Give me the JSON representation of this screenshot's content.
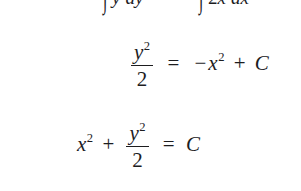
{
  "document": {
    "type": "math-worksheet-fragment",
    "background_color": "#ffffff",
    "text_color": "#1d1d1f"
  },
  "lines": {
    "integrals": {
      "id": "line-integrals",
      "clipped": "top",
      "left_integral": {
        "symbol": "∫",
        "integrand_var": "y",
        "differential": "dy"
      },
      "right_integral": {
        "symbol": "∫",
        "coefficient": "2",
        "integrand_var": "x",
        "differential": "dx"
      },
      "plain_text": "∫ y dy        ∫ 2x dx"
    },
    "antiderivative": {
      "id": "line-antideriv",
      "clipped": "right",
      "lhs": {
        "fraction_numerator_var": "y",
        "fraction_numerator_exponent": "2",
        "fraction_denominator": "2"
      },
      "relation": "=",
      "rhs": {
        "sign": "−",
        "term_var": "x",
        "term_exponent": "2",
        "plus": "+",
        "constant": "C"
      },
      "plain_text": "y²/2 = −x² + C"
    },
    "solution": {
      "id": "line-solution",
      "clipped": "none",
      "first_term_var": "x",
      "first_term_exponent": "2",
      "plus": "+",
      "fraction_numerator_var": "y",
      "fraction_numerator_exponent": "2",
      "fraction_denominator": "2",
      "relation": "=",
      "constant": "C",
      "plain_text": "x² + y²/2 = C"
    }
  },
  "glyphs": {
    "integral": "∫",
    "equals": "=",
    "plus": "+",
    "minus": "−",
    "d": "d"
  }
}
